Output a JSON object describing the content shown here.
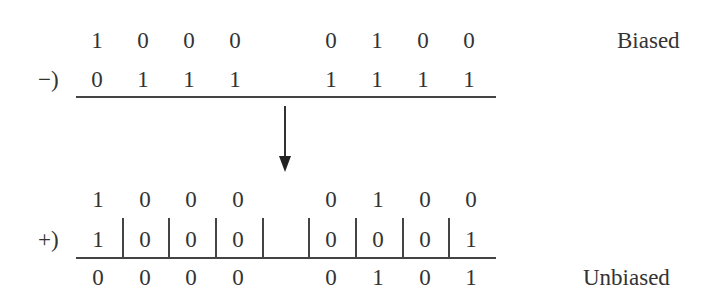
{
  "diagram": {
    "top": {
      "row_minuend": [
        "1",
        "0",
        "0",
        "0",
        "0",
        "1",
        "0",
        "0"
      ],
      "operator": "−)",
      "row_subtrahend": [
        "0",
        "1",
        "1",
        "1",
        "1",
        "1",
        "1",
        "1"
      ],
      "label": "Biased"
    },
    "arrow": "down-arrow",
    "bottom": {
      "row_addend1": [
        "1",
        "0",
        "0",
        "0",
        "0",
        "1",
        "0",
        "0"
      ],
      "operator": "+)",
      "row_addend2": [
        "1",
        "0",
        "0",
        "0",
        "0",
        "0",
        "0",
        "1"
      ],
      "row_result": [
        "0",
        "0",
        "0",
        "0",
        "0",
        "1",
        "0",
        "1"
      ],
      "label": "Unbiased"
    }
  }
}
